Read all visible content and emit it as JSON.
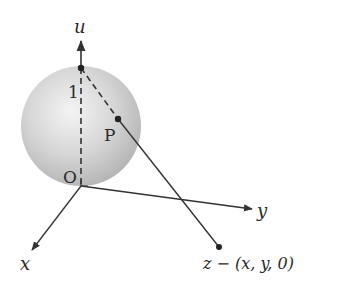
{
  "diagram": {
    "type": "stereographic-projection",
    "labels": {
      "u_axis": "u",
      "x_axis": "x",
      "y_axis": "y",
      "north_pole": "1",
      "origin": "O",
      "point_p": "P",
      "point_z": "z − (x, y, 0)"
    },
    "colors": {
      "line": "#333333",
      "sphere_light": "#f2f2f2",
      "sphere_dark": "#b8b8b8",
      "background": "#ffffff"
    }
  }
}
